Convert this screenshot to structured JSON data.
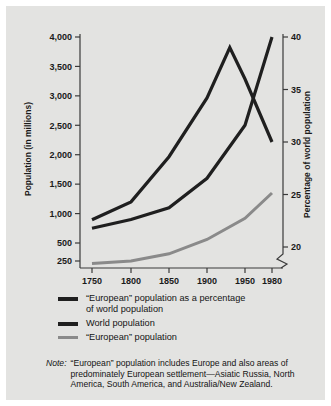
{
  "chart_data": {
    "type": "line",
    "title": "",
    "xlabel": "",
    "ylabel": "Population (in millions)",
    "y2label": "Percentage of world population",
    "x_tick_labels": [
      "1750",
      "1800",
      "1850",
      "1900",
      "1950",
      "1980"
    ],
    "x_tick_values": [
      1750,
      1800,
      1850,
      1900,
      1950,
      1980
    ],
    "y_tick_labels": [
      "250",
      "500",
      "1,000",
      "1,500",
      "2,000",
      "2,500",
      "3,000",
      "3,500",
      "4,000"
    ],
    "y_tick_values": [
      250,
      500,
      1000,
      1500,
      2000,
      2500,
      3000,
      3500,
      4000
    ],
    "ylim": [
      250,
      4000
    ],
    "y2_tick_labels": [
      "20",
      "25",
      "30",
      "35",
      "40"
    ],
    "y2_tick_values": [
      20,
      25,
      30,
      35,
      40
    ],
    "y2lim": [
      20,
      40
    ],
    "axis_break": true,
    "grid": false,
    "legend_position": "below",
    "series": [
      {
        "name": "“European” population as a percentage of world population",
        "axis": "right",
        "color": "#1f1f1f",
        "width": 3.2,
        "points": [
          {
            "x": 1750,
            "y": 22.6
          },
          {
            "x": 1800,
            "y": 24.3
          },
          {
            "x": 1850,
            "y": 28.6
          },
          {
            "x": 1900,
            "y": 34.2
          },
          {
            "x": 1930,
            "y": 39.0
          },
          {
            "x": 1950,
            "y": 36.0
          },
          {
            "x": 1980,
            "y": 30.0
          }
        ]
      },
      {
        "name": "World population",
        "axis": "left",
        "color": "#1f1f1f",
        "width": 3.2,
        "points": [
          {
            "x": 1750,
            "y": 750
          },
          {
            "x": 1800,
            "y": 900
          },
          {
            "x": 1850,
            "y": 1100
          },
          {
            "x": 1900,
            "y": 1600
          },
          {
            "x": 1950,
            "y": 2500
          },
          {
            "x": 1980,
            "y": 4000
          }
        ]
      },
      {
        "name": "“European” population",
        "axis": "left",
        "color": "#8a8a8a",
        "width": 3.0,
        "points": [
          {
            "x": 1750,
            "y": 215
          },
          {
            "x": 1800,
            "y": 250
          },
          {
            "x": 1850,
            "y": 350
          },
          {
            "x": 1900,
            "y": 560
          },
          {
            "x": 1950,
            "y": 920
          },
          {
            "x": 1980,
            "y": 1350
          }
        ]
      }
    ]
  },
  "legend": {
    "items": [
      {
        "label_line1": "“European” population as a percentage",
        "label_line2": "of world population",
        "style": "mid"
      },
      {
        "label_line1": "World population",
        "label_line2": "",
        "style": "mid"
      },
      {
        "label_line1": "“European” population",
        "label_line2": "",
        "style": "thin"
      }
    ]
  },
  "note": {
    "label": "Note:",
    "text": "“European” population includes Europe and also areas of predominately European settlement—Asiatic Russia, North America, South America, and Australia/New Zealand."
  },
  "colors": {
    "panel": "#e3e3e1",
    "axis": "#3a3a3a",
    "dark_line": "#1f1f1f",
    "gray_line": "#8a8a8a",
    "text": "#141414"
  }
}
